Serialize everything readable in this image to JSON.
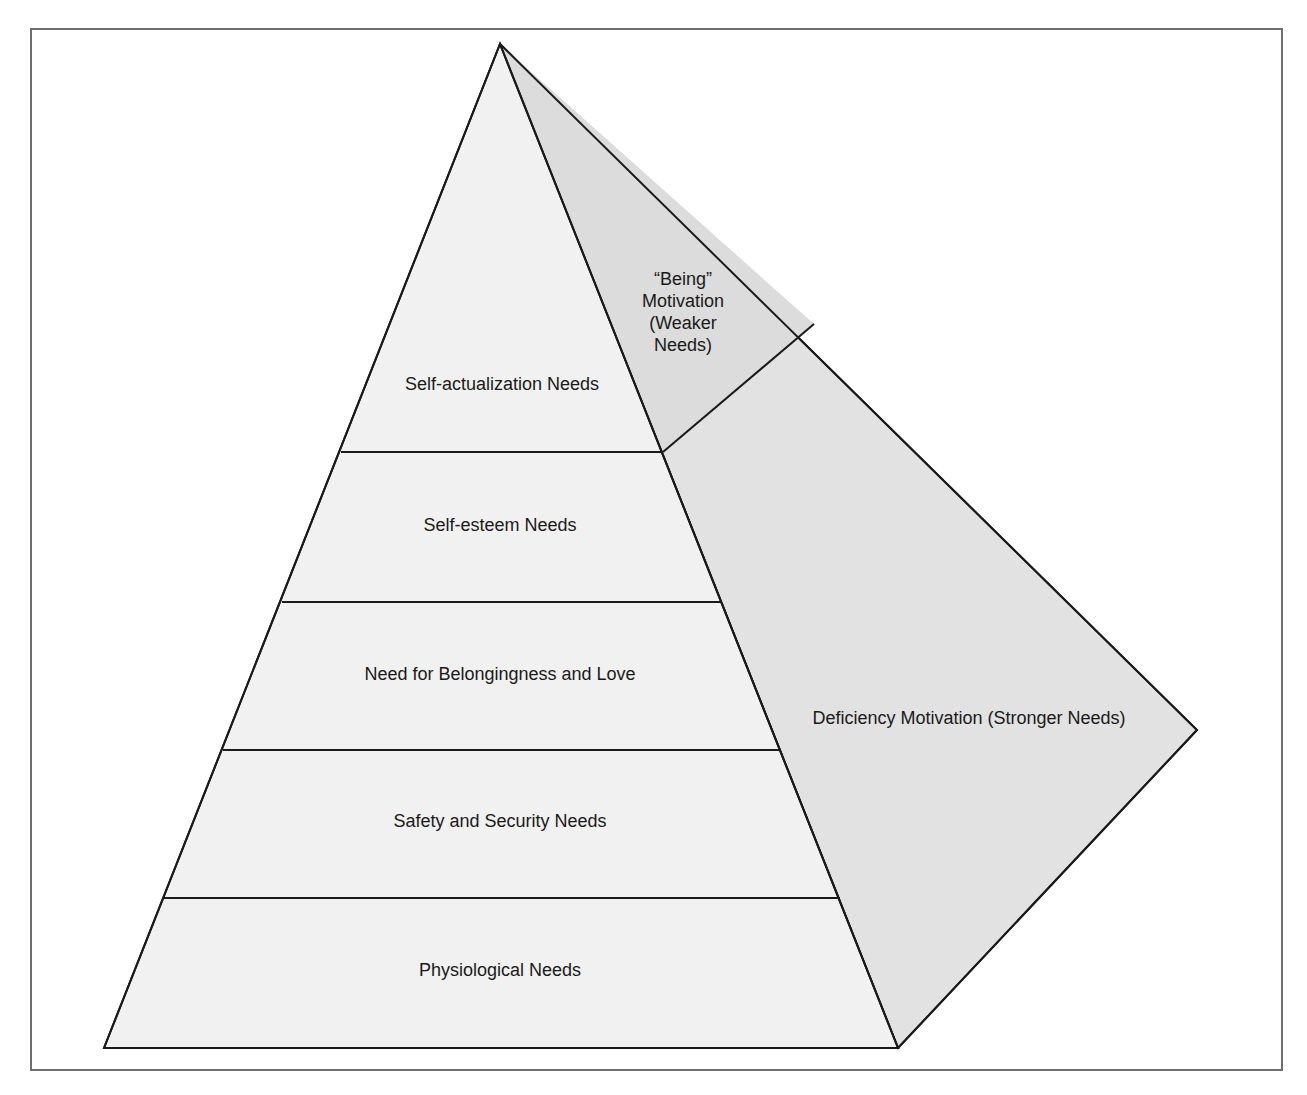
{
  "diagram": {
    "type": "pyramid",
    "colors": {
      "pyramid_fill": "#f1f1f1",
      "side_fill": "#e2e2e2",
      "line": "#1a1a1a",
      "frame": "#6e6e6e",
      "text": "#1a1a1a"
    },
    "levels": [
      {
        "label": "Self-actualization Needs"
      },
      {
        "label": "Self-esteem Needs"
      },
      {
        "label": "Need for Belongingness and Love"
      },
      {
        "label": "Safety and Security Needs"
      },
      {
        "label": "Physiological Needs"
      }
    ],
    "side": {
      "being_motivation": "“Being”\nMotivation\n(Weaker\nNeeds)",
      "deficiency_motivation": "Deficiency Motivation (Stronger Needs)"
    }
  }
}
